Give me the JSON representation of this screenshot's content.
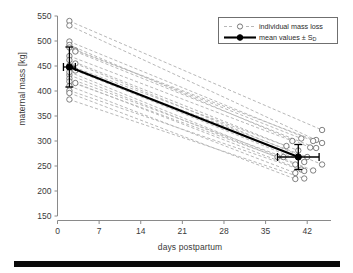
{
  "chart_data": {
    "type": "line",
    "title": "",
    "xlabel": "days postpartum",
    "ylabel": "maternal mass [kg]",
    "xlim": [
      0,
      46
    ],
    "ylim": [
      150,
      550
    ],
    "xticks": [
      0,
      7,
      14,
      21,
      28,
      35,
      42
    ],
    "yticks": [
      150,
      200,
      250,
      300,
      350,
      400,
      450,
      500,
      550
    ],
    "grid": false,
    "legend_position": "top-right",
    "legend": [
      {
        "label": "individual mass loss",
        "style": "dashed-gray-open-circle"
      },
      {
        "label": "mean values ± S_D",
        "style": "solid-black-filled-square"
      }
    ],
    "series": [
      {
        "name": "individual",
        "x": [
          2,
          44.5
        ],
        "values": [
          540,
          322
        ]
      },
      {
        "name": "individual",
        "x": [
          2,
          43.5
        ],
        "values": [
          531,
          302
        ]
      },
      {
        "name": "individual",
        "x": [
          2,
          43.0
        ],
        "values": [
          499,
          300
        ]
      },
      {
        "name": "individual",
        "x": [
          3,
          44.5
        ],
        "values": [
          481,
          296
        ]
      },
      {
        "name": "individual",
        "x": [
          2,
          42.5
        ],
        "values": [
          492,
          287
        ]
      },
      {
        "name": "individual",
        "x": [
          3,
          43.5
        ],
        "values": [
          479,
          286
        ]
      },
      {
        "name": "individual",
        "x": [
          2,
          41.0
        ],
        "values": [
          487,
          305
        ]
      },
      {
        "name": "individual",
        "x": [
          2,
          39.5
        ],
        "values": [
          470,
          300
        ]
      },
      {
        "name": "individual",
        "x": [
          2,
          38.5
        ],
        "values": [
          462,
          290
        ]
      },
      {
        "name": "individual",
        "x": [
          2,
          40.5
        ],
        "values": [
          451,
          281
        ]
      },
      {
        "name": "individual",
        "x": [
          2,
          42.0
        ],
        "values": [
          446,
          268
        ]
      },
      {
        "name": "individual",
        "x": [
          3,
          41.5
        ],
        "values": [
          441,
          258
        ]
      },
      {
        "name": "individual",
        "x": [
          2,
          40.0
        ],
        "values": [
          432,
          253
        ]
      },
      {
        "name": "individual",
        "x": [
          2,
          38.0
        ],
        "values": [
          425,
          268
        ]
      },
      {
        "name": "individual",
        "x": [
          2,
          37.0
        ],
        "values": [
          419,
          268
        ]
      },
      {
        "name": "individual",
        "x": [
          3,
          41.0
        ],
        "values": [
          416,
          243
        ]
      },
      {
        "name": "individual",
        "x": [
          2,
          40.0
        ],
        "values": [
          410,
          236
        ]
      },
      {
        "name": "individual",
        "x": [
          2,
          41.5
        ],
        "values": [
          401,
          240
        ]
      },
      {
        "name": "individual",
        "x": [
          2,
          40.0
        ],
        "values": [
          396,
          224
        ]
      },
      {
        "name": "individual",
        "x": [
          2,
          41.5
        ],
        "values": [
          383,
          225
        ]
      },
      {
        "name": "individual",
        "x": [
          3,
          44.5
        ],
        "values": [
          455,
          253
        ]
      },
      {
        "name": "individual",
        "x": [
          2,
          43.0
        ],
        "values": [
          438,
          241
        ]
      },
      {
        "name": "mean",
        "x": [
          2,
          40.5
        ],
        "values": [
          448,
          268
        ]
      }
    ],
    "mean_points": [
      {
        "x": 2,
        "y": 448,
        "sd_y": 40,
        "sd_x": 1.0
      },
      {
        "x": 40.5,
        "y": 268,
        "sd_y": 25,
        "sd_x": 3.5
      }
    ]
  },
  "colors": {
    "axis": "#8a8a8a",
    "tick_text": "#3a3a3a",
    "individual_line": "#b8b8b8",
    "marker_edge": "#6a6a6a",
    "mean_line": "#000000",
    "legend_border": "#6f6f6f",
    "bottom_bar": "#0a0a0a"
  }
}
